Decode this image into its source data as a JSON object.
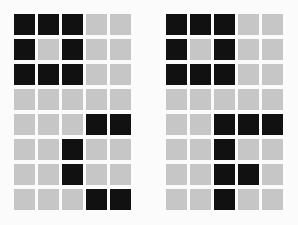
{
  "colors": {
    "filled": "#111111",
    "empty": "#c6c6c6",
    "background": "#fbfbfb"
  },
  "grids": [
    {
      "name": "left",
      "rows": 8,
      "cols": 5,
      "cells": [
        [
          1,
          1,
          1,
          0,
          0
        ],
        [
          1,
          0,
          1,
          0,
          0
        ],
        [
          1,
          1,
          1,
          0,
          0
        ],
        [
          0,
          0,
          0,
          0,
          0
        ],
        [
          0,
          0,
          0,
          1,
          1
        ],
        [
          0,
          0,
          1,
          0,
          0
        ],
        [
          0,
          0,
          1,
          0,
          0
        ],
        [
          0,
          0,
          0,
          1,
          1
        ]
      ]
    },
    {
      "name": "right",
      "rows": 8,
      "cols": 5,
      "cells": [
        [
          1,
          1,
          1,
          0,
          0
        ],
        [
          1,
          0,
          1,
          0,
          0
        ],
        [
          1,
          1,
          1,
          0,
          0
        ],
        [
          0,
          0,
          0,
          0,
          0
        ],
        [
          0,
          0,
          1,
          1,
          1
        ],
        [
          0,
          0,
          1,
          0,
          0
        ],
        [
          0,
          0,
          1,
          1,
          0
        ],
        [
          0,
          0,
          1,
          0,
          0
        ]
      ]
    }
  ]
}
